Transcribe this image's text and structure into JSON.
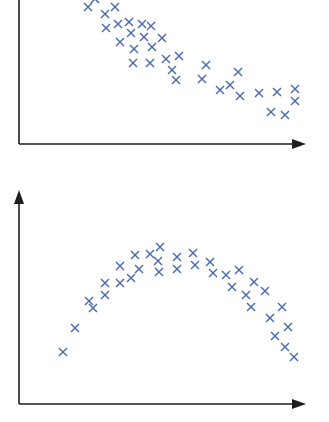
{
  "colors": {
    "marker": "#4a6bb0",
    "axis": "#1e1e1e",
    "background": "#ffffff"
  },
  "chart_data": [
    {
      "type": "scatter",
      "title": "",
      "xlabel": "",
      "ylabel": "",
      "marker": "x",
      "grid": false,
      "legend": null,
      "trend": "decreasing (negative correlation)",
      "axes": {
        "origin": [
          19,
          144
        ],
        "x_end": 306,
        "y_top": -2
      },
      "points": [
        [
          88,
          7
        ],
        [
          95,
          -1
        ],
        [
          105,
          14
        ],
        [
          115,
          7
        ],
        [
          106,
          28
        ],
        [
          118,
          24
        ],
        [
          129,
          22
        ],
        [
          142,
          24
        ],
        [
          151,
          26
        ],
        [
          120,
          42
        ],
        [
          131,
          33
        ],
        [
          144,
          37
        ],
        [
          162,
          38
        ],
        [
          134,
          49
        ],
        [
          152,
          47
        ],
        [
          133,
          63
        ],
        [
          150,
          63
        ],
        [
          166,
          59
        ],
        [
          179,
          56
        ],
        [
          172,
          70
        ],
        [
          176,
          80
        ],
        [
          206,
          65
        ],
        [
          202,
          79
        ],
        [
          238,
          72
        ],
        [
          220,
          90
        ],
        [
          230,
          85
        ],
        [
          240,
          96
        ],
        [
          259,
          93
        ],
        [
          277,
          92
        ],
        [
          295,
          89
        ],
        [
          295,
          101
        ],
        [
          271,
          112
        ],
        [
          285,
          115
        ]
      ]
    },
    {
      "type": "scatter",
      "title": "",
      "xlabel": "",
      "ylabel": "",
      "marker": "x",
      "grid": false,
      "legend": null,
      "trend": "inverted parabola (non-linear relationship)",
      "axes": {
        "origin": [
          19,
          224
        ],
        "x_end": 306,
        "y_top": 10
      },
      "points": [
        [
          63,
          172
        ],
        [
          75,
          148
        ],
        [
          89,
          121
        ],
        [
          93,
          128
        ],
        [
          105,
          115
        ],
        [
          105,
          103
        ],
        [
          120,
          86
        ],
        [
          120,
          103
        ],
        [
          131,
          98
        ],
        [
          135,
          75
        ],
        [
          139,
          89
        ],
        [
          150,
          74
        ],
        [
          160,
          67
        ],
        [
          158,
          81
        ],
        [
          159,
          92
        ],
        [
          177,
          77
        ],
        [
          177,
          89
        ],
        [
          193,
          73
        ],
        [
          195,
          85
        ],
        [
          210,
          82
        ],
        [
          213,
          93
        ],
        [
          226,
          95
        ],
        [
          239,
          90
        ],
        [
          232,
          107
        ],
        [
          254,
          102
        ],
        [
          246,
          115
        ],
        [
          265,
          111
        ],
        [
          251,
          127
        ],
        [
          282,
          127
        ],
        [
          270,
          138
        ],
        [
          288,
          147
        ],
        [
          275,
          156
        ],
        [
          285,
          167
        ],
        [
          294,
          177
        ]
      ]
    }
  ]
}
